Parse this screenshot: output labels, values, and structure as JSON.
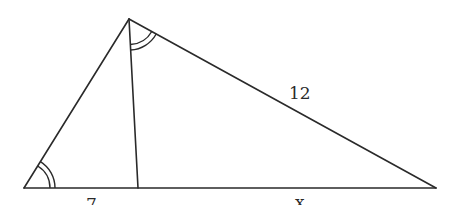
{
  "diagram": {
    "type": "triangle-with-cevian",
    "vertices": {
      "apex": [
        129,
        19
      ],
      "left": [
        24,
        188
      ],
      "foot": [
        138,
        188
      ],
      "right": [
        436,
        188
      ]
    },
    "labels": {
      "right_side": "12",
      "left_base_segment": "7",
      "right_base_segment": "x"
    },
    "angle_marks": [
      {
        "at": "left",
        "type": "double-arc",
        "note": "congruent angle"
      },
      {
        "at": "apex",
        "between": [
          "cevian",
          "right-side"
        ],
        "type": "double-arc",
        "note": "congruent angle"
      }
    ],
    "stroke_color": "#2a2a2a",
    "background": "#ffffff"
  }
}
